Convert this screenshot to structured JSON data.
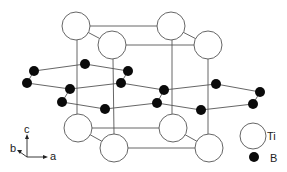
{
  "title": "",
  "colors": {
    "ti_fill": "#ffffff",
    "ti_stroke": "#555555",
    "b_fill": "#0a0a0a",
    "bond": "#555555",
    "background": "#ffffff"
  },
  "legend": {
    "ti_label": "Ti",
    "b_label": "B"
  },
  "axes": {
    "a_label": "a",
    "b_label": "b",
    "c_label": "c"
  },
  "atoms": {
    "ti": [
      {
        "x": 76,
        "y": 26
      },
      {
        "x": 112,
        "y": 45
      },
      {
        "x": 171,
        "y": 26
      },
      {
        "x": 208,
        "y": 45
      },
      {
        "x": 78,
        "y": 128
      },
      {
        "x": 114,
        "y": 148
      },
      {
        "x": 173,
        "y": 128
      },
      {
        "x": 209,
        "y": 148
      }
    ],
    "b": [
      {
        "x": 34,
        "y": 71
      },
      {
        "x": 85,
        "y": 64
      },
      {
        "x": 128,
        "y": 71
      },
      {
        "x": 27,
        "y": 83
      },
      {
        "x": 70,
        "y": 89
      },
      {
        "x": 121,
        "y": 83
      },
      {
        "x": 164,
        "y": 90
      },
      {
        "x": 216,
        "y": 84
      },
      {
        "x": 260,
        "y": 92
      },
      {
        "x": 62,
        "y": 102
      },
      {
        "x": 105,
        "y": 109
      },
      {
        "x": 157,
        "y": 103
      },
      {
        "x": 201,
        "y": 110
      },
      {
        "x": 253,
        "y": 104
      }
    ]
  }
}
